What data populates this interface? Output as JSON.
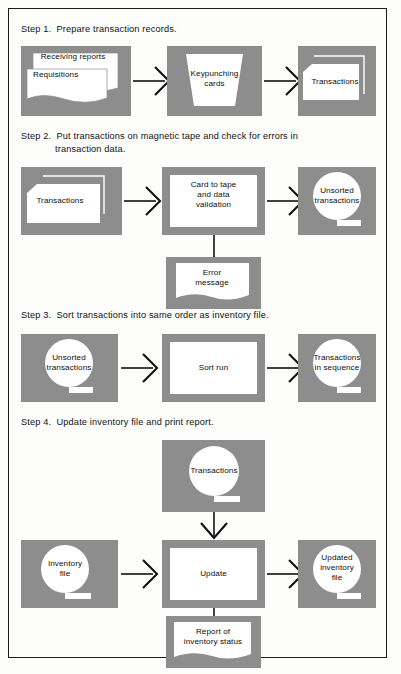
{
  "figure": {
    "kind": "flowchart",
    "colors": {
      "panel_fill": "#8d8d8d",
      "symbol_fill": "#ffffff",
      "line": "#111111",
      "page_background": "#fdfdfb",
      "border": "#1b1b1b"
    }
  },
  "steps": [
    {
      "heading_line1": "Step 1.  Prepare transaction records.",
      "heading_line2": "",
      "nodes": [
        {
          "id": "receiving-reports",
          "label": "Receiving reports",
          "symbol": "document"
        },
        {
          "id": "requisitions",
          "label": "Requisitions",
          "symbol": "document"
        },
        {
          "id": "keypunching-cards",
          "label": "Keypunching\ncards",
          "symbol": "manual-operation"
        },
        {
          "id": "transactions-cards",
          "label": "Transactions",
          "symbol": "punched-card-deck"
        }
      ]
    },
    {
      "heading_line1": "Step 2.  Put transactions on magnetic tape and check for errors in",
      "heading_line2": "transaction data.",
      "nodes": [
        {
          "id": "transactions-input",
          "label": "Transactions",
          "symbol": "punched-card-deck"
        },
        {
          "id": "card-to-tape",
          "label": "Card to tape\nand data\nvalidation",
          "symbol": "process"
        },
        {
          "id": "unsorted-transactions",
          "label": "Unsorted\ntransactions",
          "symbol": "magnetic-tape"
        },
        {
          "id": "error-message",
          "label": "Error\nmessage",
          "symbol": "document"
        }
      ]
    },
    {
      "heading_line1": "Step 3.  Sort transactions into same order as inventory file.",
      "heading_line2": "",
      "nodes": [
        {
          "id": "unsorted-transactions-2",
          "label": "Unsorted\ntransactions",
          "symbol": "magnetic-tape"
        },
        {
          "id": "sort-run",
          "label": "Sort run",
          "symbol": "process"
        },
        {
          "id": "transactions-in-sequence",
          "label": "Transactions\nin sequence",
          "symbol": "magnetic-tape"
        }
      ]
    },
    {
      "heading_line1": "Step 4.  Update inventory file and print report.",
      "heading_line2": "",
      "nodes": [
        {
          "id": "transactions-tape",
          "label": "Transactions",
          "symbol": "magnetic-tape"
        },
        {
          "id": "inventory-file",
          "label": "Inventory\nfile",
          "symbol": "magnetic-tape"
        },
        {
          "id": "update",
          "label": "Update",
          "symbol": "process"
        },
        {
          "id": "updated-inventory-file",
          "label": "Updated\ninventory\nfile",
          "symbol": "magnetic-tape"
        },
        {
          "id": "report-of-inventory-status",
          "label": "Report of\ninventory status",
          "symbol": "document"
        }
      ]
    }
  ]
}
